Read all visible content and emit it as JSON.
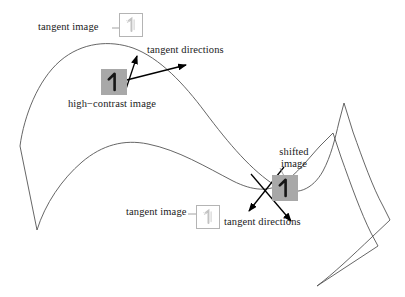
{
  "figure": {
    "background": "#ffffff",
    "stroke_color": "#555555",
    "arrow_color": "#000000",
    "patch_gray": "#a8a8a8",
    "patch_border": "#b4b4b4",
    "text_color": "#1a1a1a"
  },
  "labels": {
    "tangent_image_top": "tangent image",
    "tangent_directions_top": "tangent directions",
    "high_contrast_image": "high−contrast image",
    "shifted_image": "shifted\nimage",
    "shifted_image_line1": "shifted",
    "shifted_image_line2": "image",
    "tangent_image_bottom": "tangent image",
    "tangent_directions_bottom": "tangent directions"
  },
  "patches": {
    "tangent_image_top": {
      "name": "tangent-image-patch-top",
      "digit": "1",
      "style": "faint-gray-on-white",
      "x": 119,
      "y": 13,
      "size": 24
    },
    "high_contrast_image": {
      "name": "high-contrast-image-patch",
      "digit": "1",
      "style": "dark-on-gray",
      "x": 101,
      "y": 69,
      "size": 26
    },
    "tangent_image_bottom": {
      "name": "tangent-image-patch-bottom",
      "digit": "1",
      "style": "faint-gray-on-white",
      "x": 196,
      "y": 205,
      "size": 24
    },
    "shifted_image": {
      "name": "shifted-image-patch",
      "digit": "1",
      "style": "dark-on-gray",
      "x": 272,
      "y": 175,
      "size": 26
    }
  },
  "curves": {
    "outer_manifold": "M 20,146 C 25,118 40,80 62,62 C 84,44 110,41 132,48 C 160,57 185,82 206,110 C 230,142 252,170 276,185 C 296,197 312,190 322,172 C 330,157 334,140 338,124 L 343,105 L 352,130 C 362,158 372,186 382,205 L 389,219 L 372,236 C 352,255 332,273 316,285",
    "inner_manifold": "M 36,229 C 44,205 60,180 80,163 C 100,146 122,140 146,144 C 176,149 205,166 232,180 C 252,190 268,192 282,183 C 296,174 306,160 318,148 L 332,134 L 340,156 C 350,184 360,212 370,232 L 376,244",
    "left_vertex": "M 20,146 L 36,229",
    "right_lower": "M 316,285 L 305,270"
  },
  "tangent_vectors": {
    "top": {
      "arrow": {
        "from": [
          103,
          86
        ],
        "to": [
          188,
          65
        ],
        "name": "tangent-arrow-top-right"
      },
      "stroke": {
        "from": [
          127,
          88
        ],
        "to": [
          137,
          56
        ],
        "name": "tangent-arrow-top-up"
      }
    },
    "bottom": {
      "arrow_down_right": {
        "from": [
          252,
          175
        ],
        "to": [
          292,
          222
        ],
        "name": "tangent-arrow-bottom-down-right"
      },
      "arrow_down_left": {
        "from": [
          285,
          168
        ],
        "to": [
          248,
          212
        ],
        "name": "tangent-arrow-bottom-down-left"
      }
    }
  },
  "leaders": {
    "tangent_image_top": {
      "from": [
        114,
        29
      ],
      "to": [
        128,
        38
      ]
    },
    "tangent_image_bottom": {
      "from": [
        190,
        213
      ],
      "to": [
        196,
        213
      ]
    },
    "shifted_image": {
      "from": [
        278,
        167
      ],
      "to": [
        283,
        175
      ]
    }
  }
}
